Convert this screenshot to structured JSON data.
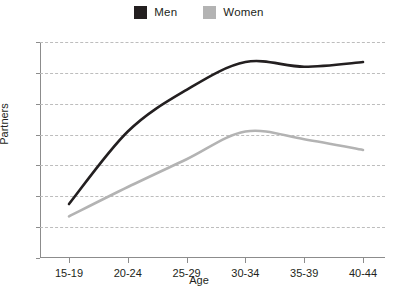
{
  "chart_data": {
    "type": "line",
    "title": "",
    "xlabel": "Age",
    "ylabel": "Partners",
    "categories": [
      "15-19",
      "20-24",
      "25-29",
      "30-34",
      "35-39",
      "40-44"
    ],
    "ylim": [
      0,
      7
    ],
    "yticks": [
      0,
      1,
      2,
      3,
      4,
      5,
      6,
      7
    ],
    "grid": true,
    "legend_position": "top-center",
    "series": [
      {
        "name": "Men",
        "color": "#231f20",
        "values": [
          1.75,
          4.1,
          5.45,
          6.35,
          6.2,
          6.35
        ]
      },
      {
        "name": "Women",
        "color": "#b3b3b3",
        "values": [
          1.35,
          2.3,
          3.2,
          4.1,
          3.85,
          3.5
        ]
      }
    ]
  },
  "legend": {
    "entries": [
      {
        "label": "Men",
        "swatch_color": "#231f20",
        "icon": "square-swatch-icon"
      },
      {
        "label": "Women",
        "swatch_color": "#b3b3b3",
        "icon": "square-swatch-icon"
      }
    ]
  },
  "axes": {
    "x_title": "Age",
    "y_title": "Partners",
    "y_tick_labels": [
      "0",
      "1",
      "2",
      "3",
      "4",
      "5",
      "6",
      "7"
    ],
    "x_tick_labels": [
      "15-19",
      "20-24",
      "25-29",
      "30-34",
      "35-39",
      "40-44"
    ]
  }
}
